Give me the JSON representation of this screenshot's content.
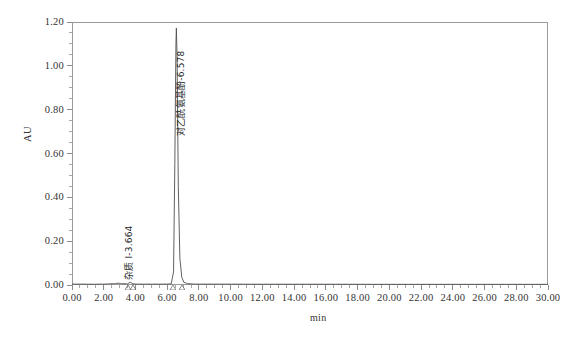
{
  "chart_data": {
    "type": "line",
    "title": "",
    "subtitle": "",
    "xlabel": "min",
    "ylabel": "AU",
    "xlim": [
      0.0,
      30.0
    ],
    "ylim": [
      0.0,
      1.2
    ],
    "grid": false,
    "legend": "none",
    "x_ticks": [
      "0.00",
      "2.00",
      "4.00",
      "6.00",
      "8.00",
      "10.00",
      "12.00",
      "14.00",
      "16.00",
      "18.00",
      "20.00",
      "22.00",
      "24.00",
      "26.00",
      "28.00",
      "30.00"
    ],
    "x_tick_values": [
      0,
      2,
      4,
      6,
      8,
      10,
      12,
      14,
      16,
      18,
      20,
      22,
      24,
      26,
      28,
      30
    ],
    "x_minor_interval": 0.5,
    "y_ticks": [
      "0.00",
      "0.20",
      "0.40",
      "0.60",
      "0.80",
      "1.00",
      "1.20"
    ],
    "y_tick_values": [
      0.0,
      0.2,
      0.4,
      0.6,
      0.8,
      1.0,
      1.2
    ],
    "y_minor_interval": 0.05,
    "series": [
      {
        "name": "detector-trace",
        "color": "#4d4d4d",
        "baseline": 0.003,
        "points": [
          {
            "x": 0.0,
            "y": 0.004
          },
          {
            "x": 0.6,
            "y": 0.004
          },
          {
            "x": 1.2,
            "y": 0.0035
          },
          {
            "x": 2.0,
            "y": 0.004
          },
          {
            "x": 2.6,
            "y": 0.006
          },
          {
            "x": 2.9,
            "y": 0.008
          },
          {
            "x": 3.2,
            "y": 0.006
          },
          {
            "x": 3.5,
            "y": 0.005
          },
          {
            "x": 3.664,
            "y": 0.013
          },
          {
            "x": 3.85,
            "y": 0.005
          },
          {
            "x": 4.2,
            "y": 0.004
          },
          {
            "x": 5.0,
            "y": 0.004
          },
          {
            "x": 5.8,
            "y": 0.004
          },
          {
            "x": 6.25,
            "y": 0.005
          },
          {
            "x": 6.4,
            "y": 0.06
          },
          {
            "x": 6.48,
            "y": 0.55
          },
          {
            "x": 6.55,
            "y": 1.1
          },
          {
            "x": 6.578,
            "y": 1.172
          },
          {
            "x": 6.62,
            "y": 1.05
          },
          {
            "x": 6.7,
            "y": 0.45
          },
          {
            "x": 6.8,
            "y": 0.12
          },
          {
            "x": 6.92,
            "y": 0.035
          },
          {
            "x": 7.05,
            "y": 0.012
          },
          {
            "x": 7.3,
            "y": 0.006
          },
          {
            "x": 7.8,
            "y": 0.004
          },
          {
            "x": 9.0,
            "y": 0.004
          },
          {
            "x": 12.0,
            "y": 0.0035
          },
          {
            "x": 16.0,
            "y": 0.0035
          },
          {
            "x": 20.0,
            "y": 0.003
          },
          {
            "x": 24.0,
            "y": 0.003
          },
          {
            "x": 28.0,
            "y": 0.003
          },
          {
            "x": 30.0,
            "y": 0.003
          }
        ]
      }
    ],
    "peaks": [
      {
        "id": "impurity-1",
        "label": "杂质 I-3.664",
        "compound": "杂质 I",
        "retention_time": "3.664",
        "retention_time_value": 3.664,
        "height_au": 0.013,
        "integration_start": 3.52,
        "integration_end": 3.82
      },
      {
        "id": "paracetamol",
        "label": "对乙酰氨基酚-6.578",
        "compound": "对乙酰氨基酚",
        "retention_time": "6.578",
        "retention_time_value": 6.578,
        "height_au": 1.172,
        "integration_start": 6.34,
        "integration_end": 6.96
      }
    ],
    "annotations": []
  },
  "axes": {
    "y_title": "AU",
    "x_title": "min"
  },
  "colors": {
    "trace": "#4d4d4d",
    "frame": "#9a9a9a",
    "tick": "#8d8d8d",
    "text": "#333333",
    "background": "#ffffff"
  }
}
